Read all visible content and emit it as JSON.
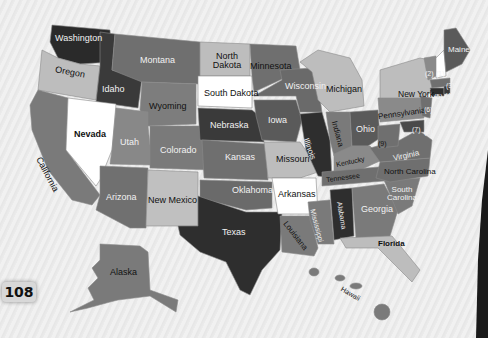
{
  "page_number": "108",
  "colors": {
    "white": "#ffffff",
    "light": "#bdbdbd",
    "mid": "#8c8c8c",
    "midDark": "#6f6f6f",
    "dark": "#4a4a4a",
    "darkest": "#2a2a2a",
    "background": "#ececec"
  },
  "states": {
    "washington": "Washington",
    "oregon": "Oregon",
    "california": "California",
    "idaho": "Idaho",
    "nevada": "Nevada",
    "montana": "Montana",
    "wyoming": "Wyoming",
    "utah": "Utah",
    "arizona": "Arizona",
    "colorado": "Colorado",
    "new_mexico": "New Mexico",
    "north_dakota": "North Dakota",
    "south_dakota": "South Dakota",
    "nebraska": "Nebraska",
    "kansas": "Kansas",
    "oklahoma": "Oklahoma",
    "texas": "Texas",
    "minnesota": "Minnesota",
    "iowa": "Iowa",
    "missouri": "Missouri",
    "arkansas": "Arkansas",
    "louisiana": "Louisiana",
    "wisconsin": "Wisconsin",
    "illinois": "Illinois",
    "michigan": "Michigan",
    "indiana": "Indiana",
    "ohio": "Ohio",
    "kentucky": "Kentucky",
    "tennessee": "Tennessee",
    "mississippi": "Mississippi",
    "alabama": "Alabama",
    "georgia": "Georgia",
    "florida": "Florida",
    "south_carolina": "South Carolina",
    "north_carolina": "North Carolina",
    "virginia": "Virginia",
    "pennsylvania": "Pennsylvania",
    "new_york": "New York",
    "maine": "Maine",
    "alaska": "Alaska",
    "hawaii": "Hawaii"
  },
  "numbered_states": {
    "n1": "(1)",
    "n2": "(2)",
    "n3": "(3)",
    "n4": "(4)",
    "n5": "(5)",
    "n6": "(6)",
    "n7": "(7)",
    "n8": "(8)",
    "n9": "(9)"
  }
}
